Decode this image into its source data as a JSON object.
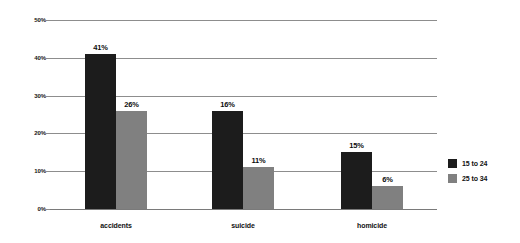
{
  "chart_data": {
    "type": "bar",
    "title": "",
    "subtitle": "",
    "xlabel": "",
    "ylabel": "",
    "categories": [
      "accidents",
      "suicide",
      "homicide"
    ],
    "series": [
      {
        "name": "15 to 24",
        "color": "#1c1c1c",
        "values": [
          41,
          26,
          15
        ],
        "labels": [
          "41%",
          "16%",
          "15%"
        ]
      },
      {
        "name": "25 to 34",
        "color": "#808080",
        "values": [
          26,
          11,
          6
        ],
        "labels": [
          "26%",
          "11%",
          "6%"
        ]
      }
    ],
    "ylim": [
      0,
      50
    ],
    "yticks": [
      0,
      10,
      20,
      30,
      40,
      50
    ],
    "ytick_labels": [
      "0%",
      "10%",
      "20%",
      "30%",
      "40%",
      "50%"
    ],
    "grid": true,
    "grid_color": "#8d8d8d",
    "legend_position": "right",
    "background": "#ffffff"
  },
  "legend": {
    "entries": [
      {
        "label": "15 to 24"
      },
      {
        "label": "25 to 34"
      }
    ]
  }
}
